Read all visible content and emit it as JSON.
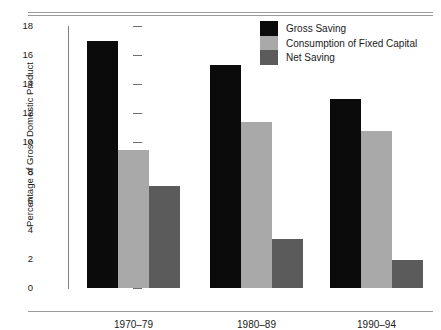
{
  "chart_data": {
    "type": "bar",
    "title": "",
    "xlabel": "",
    "ylabel": "Percentage of Gross Domestic Product",
    "categories": [
      "1970–79",
      "1980–89",
      "1990–94"
    ],
    "series": [
      {
        "name": "Gross Saving",
        "color": "#0b0b0b",
        "values": [
          17.0,
          15.3,
          13.0
        ]
      },
      {
        "name": "Consumption of Fixed Capital",
        "color": "#a9a9a9",
        "values": [
          9.5,
          11.4,
          10.8
        ]
      },
      {
        "name": "Net Saving",
        "color": "#5b5b5b",
        "values": [
          7.0,
          3.4,
          1.9
        ]
      }
    ],
    "ylim": [
      0,
      18
    ],
    "yticks": [
      0,
      2,
      4,
      6,
      8,
      10,
      12,
      14,
      16,
      18
    ],
    "ytick_labels": [
      "0",
      "2",
      "4",
      "6",
      "8",
      "10",
      "12",
      "14",
      "16",
      "18"
    ],
    "grid": false,
    "legend_position": "top-right"
  },
  "legend": {
    "items": [
      {
        "label": "Gross Saving"
      },
      {
        "label": "Consumption of Fixed Capital"
      },
      {
        "label": "Net Saving"
      }
    ]
  }
}
